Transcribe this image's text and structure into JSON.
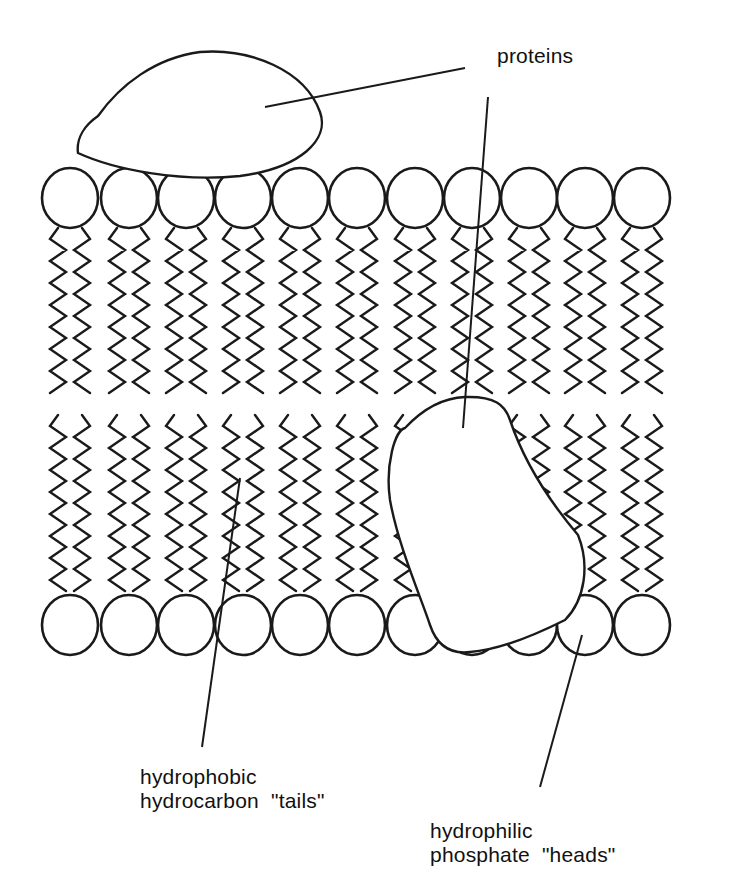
{
  "diagram": {
    "type": "lipid-bilayer-cell-membrane",
    "colors": {
      "stroke": "#1a1a1a",
      "fill": "#ffffff",
      "background": "#ffffff"
    },
    "heads": {
      "count_per_leaflet": 11,
      "radius": 28,
      "top_y": 198,
      "bottom_y": 625,
      "x_positions": [
        70,
        129,
        186,
        243,
        300,
        357,
        415,
        472,
        529,
        585,
        642
      ]
    },
    "tails": {
      "per_head": 2,
      "top_range": [
        228,
        400
      ],
      "bottom_range": [
        415,
        596
      ]
    },
    "proteins": [
      {
        "name": "peripheral-protein",
        "position": "on top of outer leaflet"
      },
      {
        "name": "integral-protein",
        "position": "spanning inner leaflet"
      }
    ],
    "labels": {
      "proteins": "proteins",
      "tails_line1": "hydrophobic",
      "tails_line2": "hydrocarbon  \"tails\"",
      "heads_line1": "hydrophilic",
      "heads_line2": "phosphate  \"heads\""
    }
  }
}
